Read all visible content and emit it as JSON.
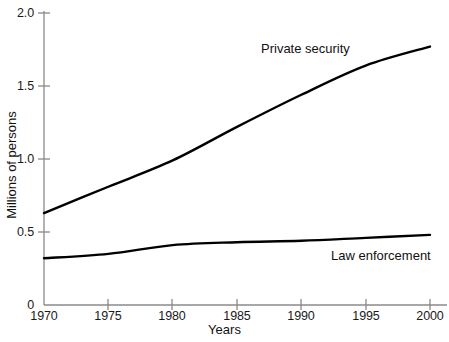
{
  "chart_data": {
    "type": "line",
    "title": "",
    "xlabel": "Years",
    "ylabel": "Millions of persons",
    "xlim": [
      1970,
      2000
    ],
    "ylim": [
      0,
      2.0
    ],
    "grid": false,
    "legend_position": "inline-labels",
    "xticks": [
      1970,
      1975,
      1980,
      1985,
      1990,
      1995,
      2000
    ],
    "xtick_labels": [
      "1970",
      "1975",
      "1980",
      "1985",
      "1990",
      "1995",
      "2000"
    ],
    "yticks": [
      0,
      0.5,
      1.0,
      1.5,
      2.0
    ],
    "ytick_labels": [
      "0",
      "0.5",
      "1.0",
      "1.5",
      "2.0"
    ],
    "x": [
      1970,
      1975,
      1980,
      1985,
      1990,
      1995,
      2000
    ],
    "series": [
      {
        "name": "Private security",
        "values": [
          0.63,
          0.81,
          0.99,
          1.22,
          1.44,
          1.64,
          1.77
        ],
        "color": "#000000"
      },
      {
        "name": "Law enforcement",
        "values": [
          0.32,
          0.35,
          0.41,
          0.43,
          0.44,
          0.46,
          0.48
        ],
        "color": "#000000"
      }
    ],
    "annotations": [
      {
        "text": "Private security",
        "x": 1988,
        "y": 1.79
      },
      {
        "text": "Law enforcement",
        "x": 1993,
        "y": 0.39
      }
    ]
  },
  "axes": {
    "x_title": "Years",
    "y_title": "Millions of persons"
  },
  "style": {
    "line_color": "#000000",
    "axis_color": "#8a8a8a",
    "background": "#ffffff",
    "text_color": "#111111"
  }
}
